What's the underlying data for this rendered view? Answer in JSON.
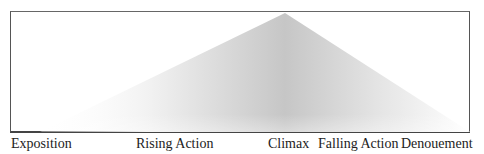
{
  "diagram": {
    "title": "",
    "type": "plot-structure-pyramid",
    "stages": [
      {
        "label": "Exposition",
        "x": 11
      },
      {
        "label": "Rising Action",
        "x": 136
      },
      {
        "label": "Climax",
        "x": 268
      },
      {
        "label": "Falling Action",
        "x": 318
      },
      {
        "label": "Denouement",
        "x": 401
      }
    ],
    "shape": {
      "peak": {
        "x": 285,
        "y": 13
      },
      "base_left": {
        "x": 40,
        "y": 132
      },
      "base_right": {
        "x": 470,
        "y": 132
      },
      "fill_light": "#ffffff",
      "fill_dark": "#c4c4c4"
    },
    "colors": {
      "frame": "#555555",
      "text": "#222222"
    }
  }
}
